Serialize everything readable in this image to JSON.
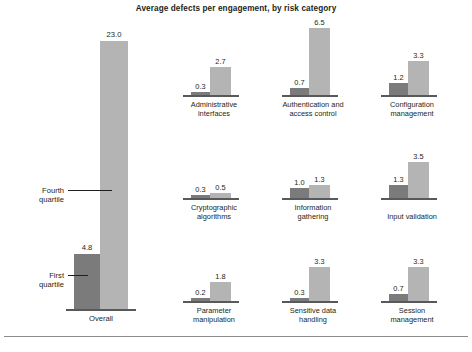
{
  "chart": {
    "title": "Average defects per engagement, by risk category"
  },
  "chart_data": {
    "type": "bar",
    "title": "Average defects per engagement, by risk category",
    "xlabel": "",
    "ylabel": "",
    "grid": false,
    "legend_position": "annotated-callouts",
    "series": [
      {
        "name": "First quartile",
        "color": "#7b7b7b"
      },
      {
        "name": "Fourth quartile",
        "color": "#b4b4b4"
      }
    ],
    "overall": {
      "category": "Overall",
      "first_quartile": 4.8,
      "fourth_quartile": 23.0,
      "ylim": [
        0,
        25.0
      ],
      "annotations": [
        {
          "label": "Fourth quartile",
          "points_to": "fourth-quartile-bar"
        },
        {
          "label": "First quartile",
          "points_to": "first-quartile-bar"
        }
      ]
    },
    "panels_ylim": [
      0,
      7.2
    ],
    "categories": [
      "Administrative interfaces",
      "Authentication and access control",
      "Configuration management",
      "Cryptographic algorithms",
      "Information gathering",
      "Input validation",
      "Parameter manipulation",
      "Sensitive data handling",
      "Session management"
    ],
    "panels": [
      {
        "category_line1": "Administrative",
        "category_line2": "interfaces",
        "first_quartile": 0.3,
        "fourth_quartile": 2.7,
        "first_quartile_label": "0.3",
        "fourth_quartile_label": "2.7"
      },
      {
        "category_line1": "Authentication and",
        "category_line2": "access control",
        "first_quartile": 0.7,
        "fourth_quartile": 6.5,
        "first_quartile_label": "0.7",
        "fourth_quartile_label": "6.5"
      },
      {
        "category_line1": "Configuration",
        "category_line2": "management",
        "first_quartile": 1.2,
        "fourth_quartile": 3.3,
        "first_quartile_label": "1.2",
        "fourth_quartile_label": "3.3"
      },
      {
        "category_line1": "Cryptographic",
        "category_line2": "algorithms",
        "first_quartile": 0.3,
        "fourth_quartile": 0.5,
        "first_quartile_label": "0.3",
        "fourth_quartile_label": "0.5"
      },
      {
        "category_line1": "Information",
        "category_line2": "gathering",
        "first_quartile": 1.0,
        "fourth_quartile": 1.3,
        "first_quartile_label": "1.0",
        "fourth_quartile_label": "1.3"
      },
      {
        "category_line1": "Input validation",
        "category_line2": "",
        "first_quartile": 1.3,
        "fourth_quartile": 3.5,
        "first_quartile_label": "1.3",
        "fourth_quartile_label": "3.5"
      },
      {
        "category_line1": "Parameter",
        "category_line2": "manipulation",
        "first_quartile": 0.2,
        "fourth_quartile": 1.8,
        "first_quartile_label": "0.2",
        "fourth_quartile_label": "1.8"
      },
      {
        "category_line1": "Sensitive data",
        "category_line2": "handling",
        "first_quartile": 0.3,
        "fourth_quartile": 3.3,
        "first_quartile_label": "0.3",
        "fourth_quartile_label": "3.3"
      },
      {
        "category_line1": "Session",
        "category_line2": "management",
        "first_quartile": 0.7,
        "fourth_quartile": 3.3,
        "first_quartile_label": "0.7",
        "fourth_quartile_label": "3.3"
      }
    ]
  },
  "overall_panel": {
    "xlabel": "Overall",
    "first_quartile_label": "4.8",
    "fourth_quartile_label": "23.0",
    "callout_fourth_line1": "Fourth",
    "callout_fourth_line2": "quartile",
    "callout_first_line1": "First",
    "callout_first_line2": "quartile"
  },
  "colors": {
    "first_quartile": "#7b7b7b",
    "fourth_quartile": "#b4b4b4",
    "axis": "#58595b",
    "text": "#231f20",
    "rule": "#8c8c8c"
  }
}
